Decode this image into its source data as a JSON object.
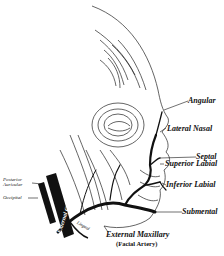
{
  "diagram": {
    "labels": {
      "angular": "Angular",
      "lateral_nasal": "Lateral Nasal",
      "septal": "Septal",
      "superior_labial": "Superior Labial",
      "inferior_labial": "Inferior Labial",
      "submental": "Submental",
      "external_maxillary": "External Maxillary",
      "facial_artery": "(Facial Artery)",
      "posterior_auricular_1": "Posterior",
      "posterior_auricular_2": "Auricular",
      "occipital": "Occipital",
      "external_carotid": "External Carotid",
      "lingual": "Lingual"
    },
    "colors": {
      "ink": "#111111",
      "background": "#ffffff"
    }
  }
}
